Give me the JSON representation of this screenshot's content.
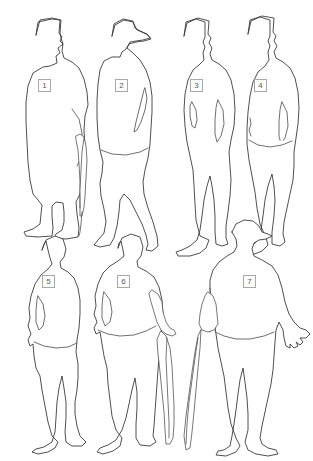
{
  "diagram": {
    "type": "line-art-silhouette-key",
    "background_color": "#ffffff",
    "outline_color": "#3b3b3b",
    "label_border_color": "#a8a8a8",
    "label_text_color": "#5a5a5a",
    "rows": 2,
    "figure_count": 7,
    "figures": [
      {
        "number": "1",
        "label": "1",
        "row": 1,
        "column": 1,
        "description": "standing man in tall top hat and long overcoat, facing right, holding an umbrella at his right side",
        "headwear": "top hat",
        "accessory": "umbrella",
        "label_x": 38,
        "label_y": 79
      },
      {
        "number": "2",
        "label": "2",
        "row": 1,
        "column": 2,
        "description": "man in profile facing left wearing a brimmed hat and knee-length coat, hand on hip",
        "headwear": "brimmed hat",
        "accessory": "none",
        "label_x": 115,
        "label_y": 79
      },
      {
        "number": "3",
        "label": "3",
        "row": 1,
        "column": 3,
        "description": "man facing forward in tall hat and long coat, both arms hanging at his sides",
        "headwear": "tall hat",
        "accessory": "none",
        "label_x": 190,
        "label_y": 79
      },
      {
        "number": "4",
        "label": "4",
        "row": 1,
        "column": 4,
        "description": "man in tall hat and long coat turned slightly, one arm bent at the hip",
        "headwear": "tall hat",
        "accessory": "none",
        "label_x": 254,
        "label_y": 79
      },
      {
        "number": "5",
        "label": "5",
        "row": 2,
        "column": 1,
        "description": "bare-headed man in a short jacket with hands at his sides",
        "headwear": "none",
        "accessory": "none",
        "label_x": 42,
        "label_y": 275
      },
      {
        "number": "6",
        "label": "6",
        "row": 2,
        "column": 2,
        "description": "bare-headed man in a long coat, one hand on hip, holding a walking stick in the other hand",
        "headwear": "none",
        "accessory": "walking stick",
        "label_x": 117,
        "label_y": 275
      },
      {
        "number": "7",
        "label": "7",
        "row": 2,
        "column": 3,
        "description": "man in a bowler hat holding a walking cane, opposite hand open with fingers visible",
        "headwear": "bowler hat",
        "accessory": "walking cane",
        "label_x": 243,
        "label_y": 275
      }
    ]
  }
}
